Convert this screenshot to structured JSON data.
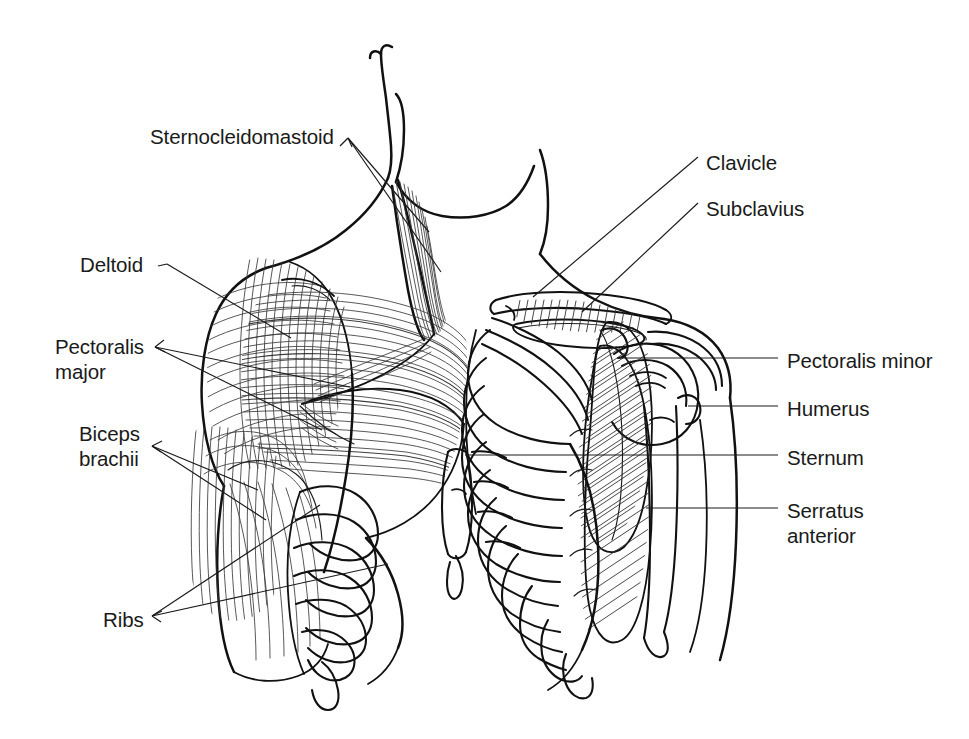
{
  "diagram": {
    "style": "black-and-white line drawing",
    "background_color": "#ffffff",
    "ink_color": "#111111",
    "view": "anterior view of chest, shoulders and upper arms; superficial muscles shown on the left side of the image, deep structures and rib cage on the right side",
    "width": 969,
    "height": 739
  },
  "labels": {
    "left": [
      {
        "id": "sternocleidomastoid",
        "text": "Sternocleidomastoid",
        "x": 150,
        "y": 124,
        "lines": 1,
        "leader_count": 2
      },
      {
        "id": "deltoid",
        "text": "Deltoid",
        "x": 80,
        "y": 252,
        "lines": 1,
        "leader_count": 1
      },
      {
        "id": "pectoralis-major",
        "text": "Pectoralis\nmajor",
        "line1": "Pectoralis",
        "line2": "major",
        "x": 55,
        "y": 334,
        "lines": 2,
        "leader_count": 2
      },
      {
        "id": "biceps-brachii",
        "text": "Biceps\nbrachii",
        "line1": "Biceps",
        "line2": "brachii",
        "x": 79,
        "y": 421,
        "lines": 2,
        "leader_count": 2
      },
      {
        "id": "ribs",
        "text": "Ribs",
        "x": 103,
        "y": 607,
        "lines": 1,
        "leader_count": 2
      }
    ],
    "right": [
      {
        "id": "clavicle",
        "text": "Clavicle",
        "x": 706,
        "y": 150,
        "lines": 1,
        "leader_count": 1
      },
      {
        "id": "subclavius",
        "text": "Subclavius",
        "x": 706,
        "y": 196,
        "lines": 1,
        "leader_count": 1
      },
      {
        "id": "pectoralis-minor",
        "text": "Pectoralis minor",
        "x": 787,
        "y": 348,
        "lines": 1,
        "leader_count": 1
      },
      {
        "id": "humerus",
        "text": "Humerus",
        "x": 787,
        "y": 396,
        "lines": 1,
        "leader_count": 1
      },
      {
        "id": "sternum",
        "text": "Sternum",
        "x": 787,
        "y": 445,
        "lines": 1,
        "leader_count": 1
      },
      {
        "id": "serratus-anterior",
        "text": "Serratus\nanterior",
        "line1": "Serratus",
        "line2": "anterior",
        "x": 787,
        "y": 498,
        "lines": 2,
        "leader_count": 1
      }
    ]
  },
  "structures": [
    {
      "name": "head-and-neck",
      "side": "center"
    },
    {
      "name": "sternocleidomastoid-muscle",
      "side": "left"
    },
    {
      "name": "deltoid-muscle",
      "side": "left"
    },
    {
      "name": "pectoralis-major-muscle",
      "side": "left"
    },
    {
      "name": "biceps-brachii-muscle",
      "side": "left"
    },
    {
      "name": "rib-cage",
      "side": "both"
    },
    {
      "name": "clavicle-bone",
      "side": "right"
    },
    {
      "name": "subclavius-muscle",
      "side": "right"
    },
    {
      "name": "pectoralis-minor-muscle",
      "side": "right"
    },
    {
      "name": "humerus-bone",
      "side": "right"
    },
    {
      "name": "sternum-bone",
      "side": "center"
    },
    {
      "name": "serratus-anterior-muscle",
      "side": "right"
    },
    {
      "name": "scapula-and-shoulder-joint",
      "side": "right"
    }
  ]
}
